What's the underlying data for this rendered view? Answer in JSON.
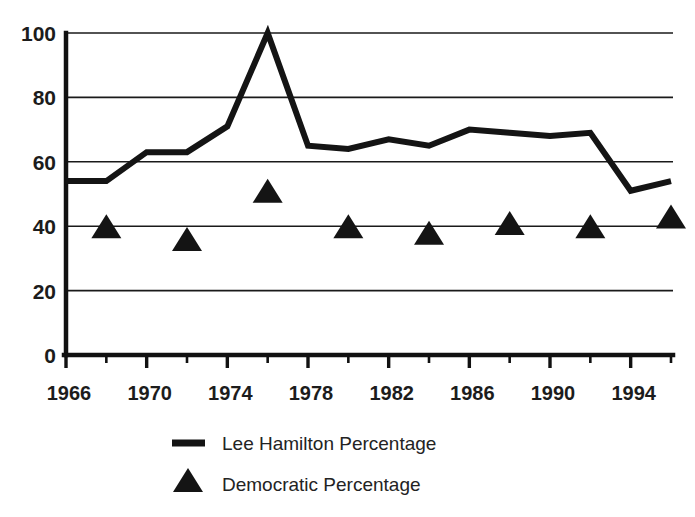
{
  "chart_data": {
    "type": "line",
    "title": "",
    "xlabel": "",
    "ylabel": "",
    "xlim": [
      1966,
      1996
    ],
    "ylim": [
      0,
      100
    ],
    "grid": true,
    "legend_position": "bottom",
    "y_ticks": [
      0,
      20,
      40,
      60,
      80,
      100
    ],
    "y_tick_labels": [
      "0",
      "20",
      "40",
      "60",
      "80",
      "100"
    ],
    "x_ticks": [
      1966,
      1968,
      1970,
      1972,
      1974,
      1976,
      1978,
      1980,
      1982,
      1984,
      1986,
      1988,
      1990,
      1992,
      1994,
      1996
    ],
    "x_tick_labels": [
      "1966",
      "",
      "1970",
      "",
      "1974",
      "",
      "1978",
      "",
      "1982",
      "",
      "1986",
      "",
      "1990",
      "",
      "1994",
      ""
    ],
    "x_labeled_ticks": [
      {
        "year": 1966,
        "label": "1966"
      },
      {
        "year": 1970,
        "label": "1970"
      },
      {
        "year": 1974,
        "label": "1974"
      },
      {
        "year": 1978,
        "label": "1978"
      },
      {
        "year": 1982,
        "label": "1982"
      },
      {
        "year": 1986,
        "label": "1986"
      },
      {
        "year": 1990,
        "label": "1990"
      },
      {
        "year": 1994,
        "label": "1994"
      }
    ],
    "series": [
      {
        "name": "Lee Hamilton Percentage",
        "marker": "none",
        "style": "line",
        "color": "#141414",
        "x": [
          1966,
          1968,
          1970,
          1972,
          1974,
          1976,
          1978,
          1980,
          1982,
          1984,
          1986,
          1988,
          1990,
          1992,
          1994,
          1996
        ],
        "values": [
          54,
          54,
          63,
          63,
          71,
          100,
          65,
          64,
          67,
          65,
          70,
          69,
          68,
          69,
          51,
          54
        ]
      },
      {
        "name": "Democratic Percentage",
        "marker": "triangle",
        "style": "scatter",
        "color": "#141414",
        "x": [
          1968,
          1972,
          1976,
          1980,
          1984,
          1988,
          1992,
          1996
        ],
        "values": [
          40,
          36,
          51,
          40,
          38,
          41,
          40,
          43
        ]
      }
    ],
    "legend_entries": [
      {
        "label": "Lee Hamilton Percentage",
        "marker": "line"
      },
      {
        "label": "Democratic Percentage",
        "marker": "triangle"
      }
    ]
  },
  "legend": {
    "item_1_label": "Lee Hamilton Percentage",
    "item_2_label": "Democratic Percentage"
  }
}
